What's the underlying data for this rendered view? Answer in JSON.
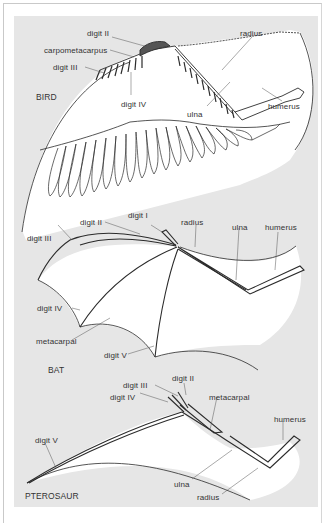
{
  "figure": {
    "panels": [
      {
        "name": "BIRD",
        "labels": {
          "digit_ii": "digit II",
          "carpometacarpus": "carpometacarpus",
          "digit_iii": "digit III",
          "digit_iv": "digit IV",
          "radius": "radius",
          "ulna": "ulna",
          "humerus": "humerus"
        }
      },
      {
        "name": "BAT",
        "labels": {
          "digit_i": "digit I",
          "digit_ii": "digit II",
          "digit_iii": "digit III",
          "digit_iv": "digit IV",
          "metacarpal": "metacarpal",
          "digit_v": "digit V",
          "radius": "radius",
          "ulna": "ulna",
          "humerus": "humerus"
        }
      },
      {
        "name": "PTEROSAUR",
        "labels": {
          "digit_ii": "digit II",
          "digit_iii": "digit III",
          "digit_iv": "digit IV",
          "metacarpal": "metacarpal",
          "humerus": "humerus",
          "digit_v": "digit V",
          "ulna": "ulna",
          "radius": "radius"
        }
      }
    ],
    "colors": {
      "background": "#ffffff",
      "panel": "#e6e6e6",
      "wing_fill": "#ffffff",
      "ink": "#2b2b2b",
      "label": "#333333"
    }
  }
}
